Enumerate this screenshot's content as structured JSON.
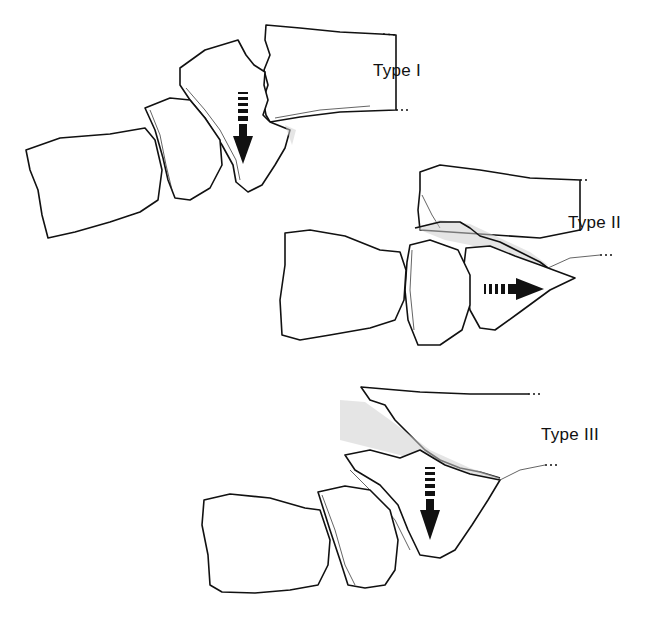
{
  "figure": {
    "panels": [
      {
        "id": "type-1",
        "label": "Type I",
        "arrow_direction": "down"
      },
      {
        "id": "type-2",
        "label": "Type II",
        "arrow_direction": "right"
      },
      {
        "id": "type-3",
        "label": "Type III",
        "arrow_direction": "down"
      }
    ],
    "colors": {
      "line": "#111111",
      "background": "#ffffff",
      "stipple": "#cfcfcf"
    }
  }
}
